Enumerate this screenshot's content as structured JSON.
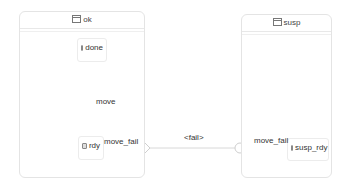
{
  "containers": [
    {
      "id": "ok",
      "title": "ok"
    },
    {
      "id": "susp",
      "title": "susp"
    }
  ],
  "states": [
    {
      "id": "done",
      "label": "done"
    },
    {
      "id": "rdy",
      "label": "rdy"
    },
    {
      "id": "susp_rdy",
      "label": "susp_rdy"
    }
  ],
  "transitions": {
    "move": "move",
    "move_fail_exit": "move_fail",
    "fail": "<fail>",
    "move_fail_entry": "move_fail"
  },
  "colors": {
    "border": "#e4e4e4",
    "edge": "#cccccc"
  }
}
